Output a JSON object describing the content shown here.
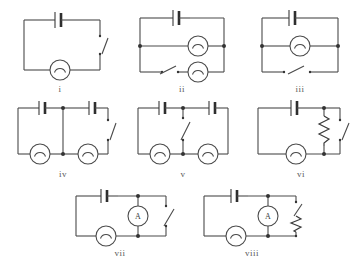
{
  "diagram": {
    "symbol_names": {
      "battery": "battery-symbol",
      "lamp": "lamp-symbol",
      "switch": "open-switch-symbol",
      "ammeter": "ammeter-symbol",
      "resistor": "resistor-symbol",
      "junction": "junction-dot"
    },
    "colors": {
      "wire": "#4a4a4a",
      "background": "#ffffff",
      "label": "#5a5a5a",
      "junction": "#333333"
    },
    "ammeter_letter": "A",
    "circuits": [
      {
        "label": "i",
        "components": [
          "battery",
          "switch",
          "lamp"
        ],
        "description": "Single loop: battery on top wire, open switch on right wire, lamp on bottom wire."
      },
      {
        "label": "ii",
        "components": [
          "battery",
          "lamp",
          "lamp",
          "switch"
        ],
        "description": "Battery on top wire; two parallel branches each with a lamp; open switch in the lower branch."
      },
      {
        "label": "iii",
        "components": [
          "battery",
          "lamp",
          "switch"
        ],
        "description": "Battery on top wire; middle parallel branch with a lamp; lower branch with an open switch."
      },
      {
        "label": "iv",
        "components": [
          "battery",
          "battery",
          "lamp",
          "lamp",
          "switch"
        ],
        "description": "Two batteries on the top wire, a central vertical link wire, two lamps on the bottom wire and an open switch on the right wire."
      },
      {
        "label": "v",
        "components": [
          "battery",
          "battery",
          "switch",
          "lamp",
          "lamp"
        ],
        "description": "Two batteries on the top wire, an open switch in the central vertical link, two lamps on the bottom wire."
      },
      {
        "label": "vi",
        "components": [
          "battery",
          "lamp",
          "resistor",
          "switch"
        ],
        "description": "Battery on top, lamp on bottom, a zigzag resistor in a vertical branch parallel with an open switch on the right wire."
      },
      {
        "label": "vii",
        "components": [
          "battery",
          "lamp",
          "ammeter",
          "switch"
        ],
        "description": "Battery on top-left, lamp on bottom-left, ammeter in a vertical branch, open switch on the right wire."
      },
      {
        "label": "viii",
        "components": [
          "battery",
          "lamp",
          "ammeter",
          "switch",
          "resistor"
        ],
        "description": "Battery on top-left, lamp on bottom-left, ammeter in a vertical branch, open switch in series with a zigzag resistor on the right wire."
      }
    ]
  }
}
